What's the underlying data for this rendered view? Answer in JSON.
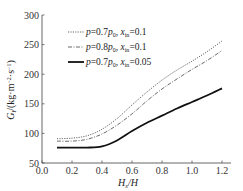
{
  "chart_data": {
    "type": "line",
    "title": "",
    "xlabel": "H_s/H",
    "ylabel": "G_l/(kg·m^-2·s^-1)",
    "xlim": [
      0.0,
      1.25
    ],
    "ylim": [
      50,
      300
    ],
    "xticks": [
      "0.0",
      "0.2",
      "0.4",
      "0.6",
      "0.8",
      "1.0",
      "1.2"
    ],
    "yticks": [
      "50",
      "100",
      "150",
      "200",
      "250",
      "300"
    ],
    "grid": false,
    "legend_position": "upper left",
    "x": [
      0.1,
      0.2,
      0.3,
      0.4,
      0.5,
      0.6,
      0.7,
      0.8,
      0.9,
      1.0,
      1.1,
      1.2
    ],
    "series": [
      {
        "name": "p=0.7p0, xin=0.1",
        "style": "dotted",
        "values": [
          91,
          92,
          96,
          107,
          125,
          148,
          170,
          190,
          207,
          222,
          238,
          256
        ]
      },
      {
        "name": "p=0.8p0, xin=0.1",
        "style": "dash-dot",
        "values": [
          87,
          87,
          90,
          99,
          114,
          133,
          155,
          175,
          192,
          208,
          223,
          240
        ]
      },
      {
        "name": "p=0.7p0, xin=0.05",
        "style": "solid",
        "values": [
          76,
          76,
          76,
          78,
          88,
          104,
          118,
          130,
          142,
          153,
          164,
          176
        ]
      }
    ]
  },
  "legend": [
    {
      "p_main": "p",
      "eq1": "=0.7",
      "p2": "p",
      "sub0": "0",
      "comma": ", ",
      "x": "x",
      "sub_in": "in",
      "val": "=0.1"
    },
    {
      "p_main": "p",
      "eq1": "=0.8",
      "p2": "p",
      "sub0": "0",
      "comma": ", ",
      "x": "x",
      "sub_in": "in",
      "val": "=0.1"
    },
    {
      "p_main": "p",
      "eq1": "=0.7",
      "p2": "p",
      "sub0": "0",
      "comma": ", ",
      "x": "x",
      "sub_in": "in",
      "val": "=0.05"
    }
  ],
  "axis_labels": {
    "x_main": "H",
    "x_sub": "s",
    "x_rest": "/H",
    "y_main": "G",
    "y_sub": "l",
    "y_rest": "/(kg·m",
    "y_sup1": "−2",
    "y_mid": "·s",
    "y_sup2": "−1",
    "y_end": ")"
  }
}
